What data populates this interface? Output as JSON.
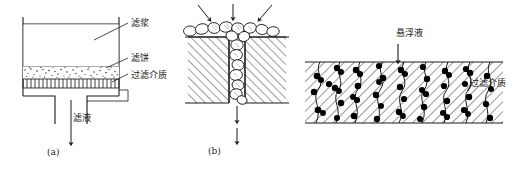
{
  "figure": {
    "background_color": "#ffffff",
    "line_color": "#1a1a1a",
    "particle_color": "#000000"
  },
  "panel_a": {
    "caption": "(a)",
    "name": "cake-filtration-vessel",
    "labels": {
      "slurry": "滤浆",
      "cake": "滤饼",
      "medium": "过滤介质",
      "filtrate": "滤液"
    }
  },
  "panel_b": {
    "caption": "(b)",
    "name": "pore-bridging-detail",
    "arrow_count_top": 3,
    "labels": {}
  },
  "panel_c": {
    "caption": "",
    "name": "deep-bed-filtration",
    "labels": {
      "suspension": "悬浮液",
      "medium": "过滤介质"
    }
  }
}
